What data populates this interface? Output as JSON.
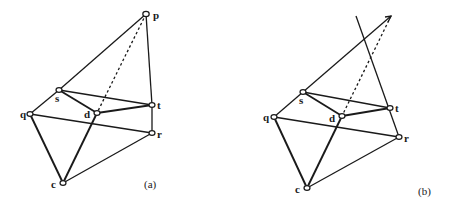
{
  "figure": {
    "panels": [
      {
        "id": "a",
        "caption": "(a)",
        "nodes": {
          "p": "p",
          "s": "s",
          "t": "t",
          "d": "d",
          "q": "q",
          "r": "r",
          "c": "c"
        }
      },
      {
        "id": "b",
        "caption": "(b)",
        "nodes": {
          "s": "s",
          "t": "t",
          "d": "d",
          "q": "q",
          "r": "r",
          "c": "c"
        }
      }
    ]
  }
}
